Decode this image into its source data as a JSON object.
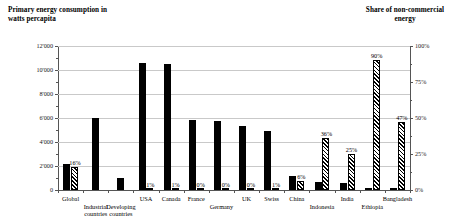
{
  "titles": {
    "left": "Primary energy consumption in watts percapita",
    "right": "Share of non-commercial energy"
  },
  "axes": {
    "left_ticks": [
      "12'000",
      "10'000",
      "8'000",
      "6'000",
      "4'000",
      "2'000",
      "0"
    ],
    "right_ticks": [
      "100%",
      "75%",
      "50%",
      "25%",
      "0%"
    ]
  },
  "chart_data": {
    "type": "bar",
    "title": "Primary energy consumption in watts percapita",
    "xlabel": "",
    "ylabel": "Primary energy consumption in watts percapita",
    "y2label": "Share of non-commercial energy",
    "ylim": [
      0,
      12000
    ],
    "y2lim": [
      0,
      100
    ],
    "grid": true,
    "legend": "none",
    "categories": [
      "Global",
      "Industrial countries",
      "Developing countries",
      "USA",
      "Canada",
      "France",
      "Germany",
      "UK",
      "Swiss",
      "China",
      "Indonesia",
      "India",
      "Ethiopia",
      "Bangladesh"
    ],
    "category_lines": [
      [
        "Global"
      ],
      [
        "Industrial",
        "countries"
      ],
      [
        "Developing",
        "countries"
      ],
      [
        "USA"
      ],
      [
        "Canada"
      ],
      [
        "France"
      ],
      [
        "Germany"
      ],
      [
        "UK"
      ],
      [
        "Swiss"
      ],
      [
        "China"
      ],
      [
        "Indonesia"
      ],
      [
        "India"
      ],
      [
        "Ethiopia"
      ],
      [
        "Bangladesh"
      ]
    ],
    "series": [
      {
        "name": "Primary energy consumption",
        "axis": "left",
        "unit": "watts per capita",
        "style": "solid-black",
        "values": [
          2200,
          6000,
          1000,
          10600,
          10500,
          5800,
          5750,
          5300,
          4950,
          1200,
          700,
          600,
          150,
          200
        ]
      },
      {
        "name": "Share of non-commercial energy",
        "axis": "right",
        "unit": "%",
        "style": "diagonal-hatch",
        "values": [
          16,
          null,
          null,
          1,
          1,
          0,
          0,
          0,
          1,
          6,
          36,
          25,
          90,
          47
        ],
        "labels": [
          "16%",
          "",
          "",
          "1%",
          "1%",
          "0%",
          "0%",
          "0%",
          "1%",
          "6%",
          "36%",
          "25%",
          "90%",
          "47%"
        ]
      }
    ]
  }
}
